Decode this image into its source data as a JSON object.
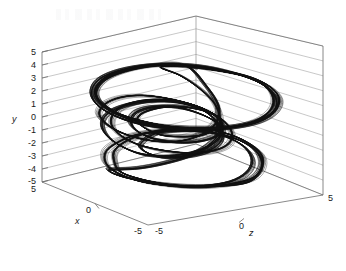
{
  "figure": {
    "kind": "matlab-3d-plot",
    "background": "#ffffff",
    "line_color": "#101010",
    "axis_color": "#6b6b6b",
    "grid_color": "#9a9a9a",
    "text_color": "#1a1a1a"
  },
  "axes": {
    "y": {
      "label": "y",
      "ticks": [
        "5",
        "4",
        "3",
        "2",
        "1",
        "0",
        "-1",
        "-2",
        "-3",
        "-4",
        "-5"
      ],
      "values": [
        5,
        4,
        3,
        2,
        1,
        0,
        -1,
        -2,
        -3,
        -4,
        -5
      ],
      "range": [
        -5,
        5
      ]
    },
    "x": {
      "label": "x",
      "ticks": [
        "0",
        "-5"
      ],
      "values": [
        0,
        -5
      ],
      "range": [
        -5,
        5
      ]
    },
    "z": {
      "label": "z",
      "ticks": [
        "-5",
        "0",
        "5"
      ],
      "values": [
        -5,
        0,
        5
      ],
      "range": [
        -5,
        5
      ]
    },
    "corner_bottom_left": "5"
  },
  "chart_data": {
    "type": "line",
    "title": "",
    "xlabel": "x",
    "ylabel": "y",
    "zlabel": "z",
    "xlim": [
      -5,
      5
    ],
    "ylim": [
      -5,
      5
    ],
    "zlim": [
      -5,
      5
    ],
    "grid": true,
    "legend": "none",
    "series": [
      {
        "name": "trajectory",
        "color": "#101010",
        "points_xyz": [
          [
            0.2,
            4.4,
            0.3
          ],
          [
            1.6,
            4.3,
            1.3
          ],
          [
            2.7,
            3.9,
            2.3
          ],
          [
            3.4,
            3.2,
            3.0
          ],
          [
            3.7,
            2.3,
            3.3
          ],
          [
            3.5,
            1.3,
            3.1
          ],
          [
            2.9,
            0.5,
            2.5
          ],
          [
            2.0,
            0.0,
            1.6
          ],
          [
            0.9,
            -0.3,
            0.6
          ],
          [
            -0.3,
            -0.4,
            -0.4
          ],
          [
            -1.5,
            -0.3,
            -1.3
          ],
          [
            -2.6,
            0.1,
            -2.1
          ],
          [
            -3.4,
            0.8,
            -2.7
          ],
          [
            -3.8,
            1.7,
            -2.9
          ],
          [
            -3.6,
            2.7,
            -2.7
          ],
          [
            -2.9,
            3.5,
            -2.1
          ],
          [
            -1.8,
            4.1,
            -1.2
          ],
          [
            -0.5,
            4.4,
            -0.1
          ],
          [
            0.8,
            4.4,
            0.9
          ],
          [
            2.1,
            4.1,
            1.8
          ],
          [
            3.1,
            3.5,
            2.6
          ],
          [
            3.6,
            2.6,
            3.1
          ],
          [
            3.6,
            1.6,
            3.1
          ],
          [
            3.1,
            0.7,
            2.6
          ],
          [
            2.2,
            0.1,
            1.8
          ],
          [
            1.0,
            -0.2,
            0.8
          ],
          [
            -0.2,
            -0.3,
            -0.2
          ],
          [
            -1.4,
            -0.2,
            -1.2
          ],
          [
            -2.5,
            0.2,
            -2.0
          ],
          [
            -3.3,
            0.9,
            -2.6
          ],
          [
            -3.6,
            1.8,
            -2.8
          ],
          [
            -3.3,
            2.8,
            -2.5
          ],
          [
            -2.5,
            3.6,
            -1.8
          ],
          [
            -1.3,
            4.2,
            -0.8
          ],
          [
            0.0,
            4.4,
            0.2
          ],
          [
            0.9,
            3.0,
            0.8
          ],
          [
            1.4,
            1.5,
            1.2
          ],
          [
            1.3,
            0.2,
            1.1
          ],
          [
            0.7,
            -0.8,
            0.6
          ],
          [
            -0.2,
            -1.4,
            -0.2
          ],
          [
            -1.2,
            -1.5,
            -1.0
          ],
          [
            -2.2,
            -1.2,
            -1.8
          ],
          [
            -3.0,
            -0.6,
            -2.4
          ],
          [
            -3.4,
            0.2,
            -2.7
          ],
          [
            -3.2,
            1.0,
            -2.5
          ],
          [
            -2.6,
            1.6,
            -2.0
          ],
          [
            -1.7,
            1.9,
            -1.3
          ],
          [
            -0.6,
            1.8,
            -0.4
          ],
          [
            0.5,
            1.4,
            0.5
          ],
          [
            1.4,
            0.7,
            1.2
          ],
          [
            1.9,
            -0.2,
            1.6
          ],
          [
            1.9,
            -1.1,
            1.6
          ],
          [
            1.4,
            -1.8,
            1.2
          ],
          [
            0.5,
            -2.2,
            0.4
          ],
          [
            -0.6,
            -2.2,
            -0.5
          ],
          [
            -1.7,
            -1.9,
            -1.4
          ],
          [
            -2.5,
            -1.3,
            -2.0
          ],
          [
            -2.9,
            -0.5,
            -2.3
          ],
          [
            -2.8,
            0.4,
            -2.2
          ],
          [
            -2.3,
            1.1,
            -1.8
          ],
          [
            -1.4,
            1.6,
            -1.1
          ],
          [
            -0.4,
            1.7,
            -0.3
          ],
          [
            0.6,
            1.4,
            0.5
          ],
          [
            1.3,
            0.8,
            1.1
          ],
          [
            1.6,
            0.0,
            1.3
          ],
          [
            1.5,
            -0.9,
            1.2
          ],
          [
            1.0,
            -1.7,
            0.8
          ],
          [
            0.2,
            -2.3,
            0.1
          ],
          [
            -0.7,
            -2.6,
            -0.6
          ],
          [
            -1.6,
            -2.6,
            -1.3
          ],
          [
            -2.4,
            -2.2,
            -1.9
          ],
          [
            -3.0,
            -1.5,
            -2.4
          ],
          [
            -3.3,
            -0.6,
            -2.6
          ],
          [
            -3.1,
            0.3,
            -2.4
          ],
          [
            -2.4,
            1.0,
            -1.9
          ],
          [
            -1.4,
            1.5,
            -1.1
          ],
          [
            -0.3,
            1.6,
            -0.2
          ],
          [
            0.7,
            1.2,
            0.6
          ],
          [
            1.3,
            0.4,
            1.1
          ],
          [
            1.4,
            -0.6,
            1.2
          ],
          [
            1.0,
            -1.6,
            0.8
          ],
          [
            0.2,
            -2.5,
            0.2
          ],
          [
            -0.8,
            -3.2,
            -0.6
          ],
          [
            -1.8,
            -3.7,
            -1.4
          ],
          [
            -2.6,
            -3.9,
            -2.1
          ],
          [
            -3.0,
            -4.0,
            -2.4
          ],
          [
            -2.8,
            -4.3,
            -2.2
          ],
          [
            -2.1,
            -4.6,
            -1.6
          ],
          [
            -1.0,
            -4.8,
            -0.7
          ],
          [
            0.3,
            -4.8,
            0.3
          ],
          [
            1.5,
            -4.6,
            1.3
          ],
          [
            2.5,
            -4.2,
            2.1
          ],
          [
            3.0,
            -3.5,
            2.5
          ],
          [
            3.2,
            -2.6,
            2.6
          ],
          [
            3.0,
            -1.7,
            2.4
          ],
          [
            2.4,
            -1.0,
            1.9
          ],
          [
            1.5,
            -0.6,
            1.2
          ],
          [
            0.4,
            -0.5,
            0.3
          ],
          [
            -0.7,
            -0.7,
            -0.6
          ],
          [
            -1.8,
            -1.1,
            -1.5
          ],
          [
            -2.6,
            -1.8,
            -2.1
          ],
          [
            -3.1,
            -2.6,
            -2.5
          ],
          [
            -3.1,
            -3.5,
            -2.5
          ],
          [
            -2.7,
            -4.2,
            -2.1
          ],
          [
            -1.8,
            -4.7,
            -1.4
          ],
          [
            -0.6,
            -4.9,
            -0.4
          ],
          [
            0.7,
            -4.8,
            0.6
          ],
          [
            1.9,
            -4.4,
            1.6
          ],
          [
            2.8,
            -3.8,
            2.3
          ],
          [
            3.2,
            -2.9,
            2.6
          ],
          [
            3.2,
            -2.0,
            2.6
          ],
          [
            2.8,
            -1.2,
            2.2
          ],
          [
            2.0,
            -0.6,
            1.6
          ],
          [
            1.0,
            -0.3,
            0.8
          ],
          [
            -0.1,
            -0.4,
            -0.1
          ],
          [
            -1.2,
            -0.8,
            -1.0
          ],
          [
            -2.1,
            -1.5,
            -1.7
          ],
          [
            -2.7,
            -2.4,
            -2.2
          ],
          [
            -2.8,
            -3.3,
            -2.2
          ],
          [
            -2.5,
            -4.1,
            -2.0
          ],
          [
            -1.6,
            -4.6,
            -1.2
          ],
          [
            -0.4,
            -4.8,
            -0.3
          ],
          [
            0.8,
            -4.7,
            0.7
          ],
          [
            1.9,
            -4.2,
            1.6
          ],
          [
            2.6,
            -3.4,
            2.1
          ],
          [
            2.8,
            -2.5,
            2.3
          ],
          [
            2.6,
            -1.6,
            2.1
          ],
          [
            2.0,
            -0.9,
            1.6
          ],
          [
            1.1,
            -0.5,
            0.9
          ],
          [
            0.1,
            -0.5,
            0.1
          ],
          [
            -0.9,
            -0.8,
            -0.8
          ],
          [
            -1.5,
            -1.4,
            -1.2
          ],
          [
            -1.7,
            -2.0,
            -1.4
          ],
          [
            -1.4,
            -2.5,
            -1.1
          ],
          [
            -0.7,
            -2.7,
            -0.6
          ],
          [
            0.2,
            -2.5,
            0.2
          ],
          [
            1.0,
            -2.0,
            0.8
          ],
          [
            1.5,
            -1.3,
            1.2
          ],
          [
            1.6,
            -0.5,
            1.3
          ],
          [
            1.3,
            0.3,
            1.1
          ],
          [
            0.6,
            0.9,
            0.5
          ],
          [
            -0.3,
            1.2,
            -0.2
          ],
          [
            -1.2,
            1.1,
            -1.0
          ],
          [
            -1.9,
            0.6,
            -1.5
          ],
          [
            -2.1,
            -0.1,
            -1.7
          ],
          [
            -1.9,
            -0.8,
            -1.5
          ],
          [
            -1.2,
            -1.3,
            -1.0
          ],
          [
            -0.3,
            -1.5,
            -0.2
          ],
          [
            0.6,
            -1.3,
            0.5
          ],
          [
            1.3,
            -0.8,
            1.1
          ],
          [
            1.6,
            -0.1,
            1.3
          ],
          [
            1.4,
            0.6,
            1.2
          ],
          [
            0.8,
            1.1,
            0.7
          ],
          [
            -0.1,
            1.3,
            -0.1
          ],
          [
            -0.9,
            1.1,
            -0.7
          ],
          [
            -1.6,
            0.6,
            -1.3
          ],
          [
            -1.8,
            0.0,
            -1.5
          ],
          [
            -1.5,
            -0.6,
            -1.2
          ],
          [
            -0.8,
            -1.0,
            -0.7
          ],
          [
            0.1,
            -1.0,
            0.1
          ],
          [
            0.9,
            -0.7,
            0.7
          ],
          [
            1.4,
            0.0,
            1.2
          ],
          [
            1.5,
            0.9,
            1.2
          ],
          [
            1.2,
            1.9,
            1.0
          ],
          [
            0.6,
            2.9,
            0.5
          ],
          [
            -0.1,
            3.7,
            -0.1
          ],
          [
            -0.9,
            4.2,
            -0.7
          ],
          [
            0.1,
            4.4,
            0.1
          ],
          [
            1.2,
            4.3,
            1.0
          ],
          [
            2.4,
            4.0,
            2.0
          ],
          [
            3.2,
            3.4,
            2.7
          ],
          [
            3.6,
            2.5,
            3.0
          ],
          [
            3.5,
            1.5,
            2.9
          ],
          [
            2.9,
            0.6,
            2.4
          ],
          [
            1.9,
            0.0,
            1.6
          ],
          [
            0.7,
            -0.3,
            0.6
          ],
          [
            -0.5,
            -0.3,
            -0.4
          ],
          [
            -1.7,
            0.0,
            -1.4
          ],
          [
            -2.7,
            0.5,
            -2.2
          ],
          [
            -3.4,
            1.3,
            -2.7
          ],
          [
            -3.5,
            2.2,
            -2.8
          ],
          [
            -3.0,
            3.2,
            -2.4
          ],
          [
            -2.0,
            4.0,
            -1.5
          ],
          [
            -0.8,
            4.4,
            -0.5
          ],
          [
            0.5,
            4.4,
            0.4
          ]
        ]
      }
    ]
  }
}
